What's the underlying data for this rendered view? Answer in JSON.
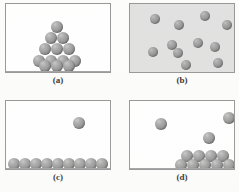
{
  "figure": {
    "sphere_color": "#8f8f8f",
    "sphere_highlight": "#c2c2c2",
    "panel_border_color": "#8d8d8d",
    "page_background": "#fcfcfb"
  },
  "panels": [
    {
      "id": "a",
      "caption": "(a)",
      "background": "#ffffff",
      "background_name": "white",
      "description": "solid: close-packed pyramid stack of spheres resting on the container floor",
      "frame": {
        "x": 5,
        "y": 3,
        "w": 106,
        "h": 70
      },
      "caption_pos": {
        "x": 38,
        "y": 75
      },
      "sphere_radius": 6,
      "spheres": [
        {
          "cx": 56,
          "cy": 26
        },
        {
          "cx": 50,
          "cy": 37
        },
        {
          "cx": 62,
          "cy": 37
        },
        {
          "cx": 44,
          "cy": 48
        },
        {
          "cx": 56,
          "cy": 48
        },
        {
          "cx": 68,
          "cy": 48
        },
        {
          "cx": 38,
          "cy": 60
        },
        {
          "cx": 50,
          "cy": 60
        },
        {
          "cx": 62,
          "cy": 60
        },
        {
          "cx": 74,
          "cy": 60
        },
        {
          "cx": 44,
          "cy": 65
        },
        {
          "cx": 56,
          "cy": 65
        },
        {
          "cx": 68,
          "cy": 65
        }
      ]
    },
    {
      "id": "b",
      "caption": "(b)",
      "background": "#dedede",
      "background_name": "gray",
      "description": "gas: widely separated spheres dispersed throughout the whole container",
      "frame": {
        "x": 129,
        "y": 3,
        "w": 106,
        "h": 70
      },
      "caption_pos": {
        "x": 162,
        "y": 75
      },
      "sphere_radius": 5,
      "spheres": [
        {
          "cx": 154,
          "cy": 18
        },
        {
          "cx": 178,
          "cy": 24
        },
        {
          "cx": 204,
          "cy": 15
        },
        {
          "cx": 226,
          "cy": 24
        },
        {
          "cx": 171,
          "cy": 44
        },
        {
          "cx": 197,
          "cy": 42
        },
        {
          "cx": 152,
          "cy": 51
        },
        {
          "cx": 177,
          "cy": 52
        },
        {
          "cx": 214,
          "cy": 46
        },
        {
          "cx": 185,
          "cy": 64
        },
        {
          "cx": 217,
          "cy": 62
        }
      ]
    },
    {
      "id": "c",
      "caption": "(c)",
      "background": "#ffffff",
      "background_name": "white",
      "description": "liquid with one escaping particle: single layer of spheres lining the floor plus one sphere in the space above",
      "frame": {
        "x": 5,
        "y": 100,
        "w": 106,
        "h": 70
      },
      "caption_pos": {
        "x": 38,
        "y": 172
      },
      "sphere_radius": 6,
      "spheres": [
        {
          "cx": 78,
          "cy": 122
        },
        {
          "cx": 13,
          "cy": 163
        },
        {
          "cx": 24,
          "cy": 163
        },
        {
          "cx": 35,
          "cy": 163
        },
        {
          "cx": 46,
          "cy": 163
        },
        {
          "cx": 57,
          "cy": 163
        },
        {
          "cx": 68,
          "cy": 163
        },
        {
          "cx": 79,
          "cy": 163
        },
        {
          "cx": 90,
          "cy": 163
        },
        {
          "cx": 101,
          "cy": 163
        }
      ]
    },
    {
      "id": "d",
      "caption": "(d)",
      "background": "#ffffff",
      "background_name": "white",
      "description": "liquid-vapour equilibrium: a two-layer cluster of spheres on the floor with three spheres in the vapour space above",
      "frame": {
        "x": 129,
        "y": 100,
        "w": 106,
        "h": 70
      },
      "caption_pos": {
        "x": 162,
        "y": 172
      },
      "sphere_radius": 6,
      "spheres": [
        {
          "cx": 160,
          "cy": 123
        },
        {
          "cx": 228,
          "cy": 117
        },
        {
          "cx": 208,
          "cy": 137
        },
        {
          "cx": 186,
          "cy": 155
        },
        {
          "cx": 198,
          "cy": 155
        },
        {
          "cx": 210,
          "cy": 155
        },
        {
          "cx": 222,
          "cy": 155
        },
        {
          "cx": 180,
          "cy": 164
        },
        {
          "cx": 192,
          "cy": 164
        },
        {
          "cx": 204,
          "cy": 164
        },
        {
          "cx": 216,
          "cy": 164
        },
        {
          "cx": 228,
          "cy": 164
        }
      ]
    }
  ]
}
